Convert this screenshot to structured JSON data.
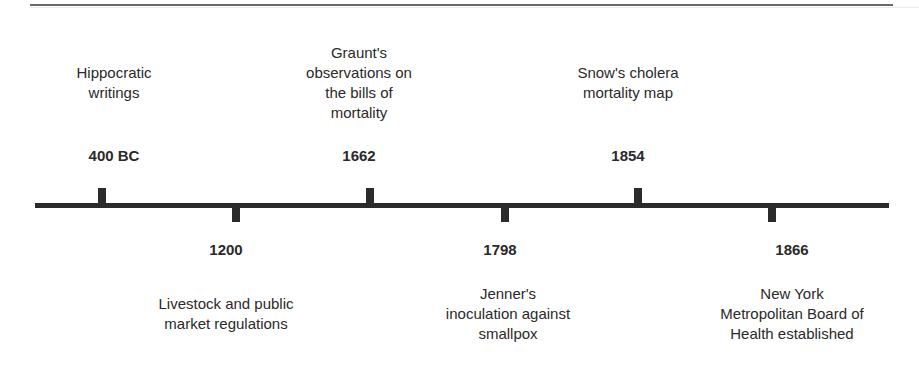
{
  "timeline": {
    "events": [
      {
        "year": "400 BC",
        "description_lines": [
          "Hippocratic",
          "writings"
        ],
        "position": "above"
      },
      {
        "year": "1200",
        "description_lines": [
          "Livestock and public",
          "market regulations"
        ],
        "position": "below"
      },
      {
        "year": "1662",
        "description_lines": [
          "Graunt's",
          "observations on",
          "the bills of",
          "mortality"
        ],
        "position": "above"
      },
      {
        "year": "1798",
        "description_lines": [
          "Jenner's",
          "inoculation against",
          "smallpox"
        ],
        "position": "below"
      },
      {
        "year": "1854",
        "description_lines": [
          "Snow's cholera",
          "mortality map"
        ],
        "position": "above"
      },
      {
        "year": "1866",
        "description_lines": [
          "New York",
          "Metropolitan Board of",
          "Health established"
        ],
        "position": "below"
      }
    ]
  },
  "colors": {
    "axis": "#2b2b2b",
    "text": "#2a2a2a",
    "background": "#ffffff"
  }
}
